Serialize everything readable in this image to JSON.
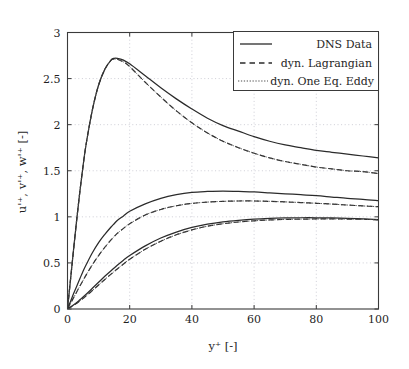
{
  "chart_data": {
    "type": "line",
    "title": "",
    "xlabel": "y⁺ [-]",
    "ylabel": "u'⁺, v'⁺, w'⁺ [-]",
    "xlim": [
      0,
      100
    ],
    "ylim": [
      0,
      3
    ],
    "xticks": [
      0,
      20,
      40,
      60,
      80,
      100
    ],
    "xtick_labels": [
      "0",
      "20",
      "40",
      "60",
      "80",
      "100"
    ],
    "yticks": [
      0,
      0.5,
      1,
      1.5,
      2,
      2.5,
      3
    ],
    "ytick_labels": [
      "0",
      "0.5",
      "1",
      "1.5",
      "2",
      "2.5",
      "3"
    ],
    "grid": true,
    "legend_position": "upper right",
    "legend_entries": [
      "DNS Data",
      "dyn. Lagrangian",
      "dyn. One Eq. Eddy"
    ],
    "x": [
      0,
      1,
      2,
      3,
      4,
      5,
      6,
      8,
      10,
      12,
      14,
      15,
      16,
      18,
      20,
      25,
      30,
      35,
      40,
      45,
      50,
      55,
      60,
      65,
      70,
      75,
      80,
      85,
      90,
      95,
      100
    ],
    "series": [
      {
        "name": "DNS Data u'⁺",
        "style": "solid",
        "color": "#2b2b2b",
        "values": [
          0,
          0.33,
          0.66,
          0.98,
          1.28,
          1.55,
          1.79,
          2.16,
          2.43,
          2.6,
          2.7,
          2.72,
          2.72,
          2.7,
          2.66,
          2.53,
          2.4,
          2.28,
          2.17,
          2.07,
          1.99,
          1.93,
          1.87,
          1.82,
          1.78,
          1.75,
          1.72,
          1.7,
          1.68,
          1.66,
          1.64
        ]
      },
      {
        "name": "dyn. Lagrangian u'⁺",
        "style": "dashed",
        "color": "#2b2b2b",
        "values": [
          0,
          0.33,
          0.66,
          0.98,
          1.28,
          1.55,
          1.79,
          2.16,
          2.43,
          2.6,
          2.7,
          2.71,
          2.71,
          2.68,
          2.63,
          2.46,
          2.3,
          2.15,
          2.02,
          1.91,
          1.82,
          1.75,
          1.69,
          1.64,
          1.6,
          1.57,
          1.54,
          1.52,
          1.5,
          1.49,
          1.47
        ]
      },
      {
        "name": "dyn. One Eq. Eddy u'⁺",
        "style": "dotted",
        "color": "#4d4d4d",
        "values": [
          0,
          0.33,
          0.66,
          0.98,
          1.28,
          1.55,
          1.79,
          2.16,
          2.43,
          2.6,
          2.7,
          2.71,
          2.71,
          2.68,
          2.63,
          2.46,
          2.3,
          2.15,
          2.02,
          1.91,
          1.82,
          1.75,
          1.69,
          1.64,
          1.6,
          1.57,
          1.54,
          1.52,
          1.5,
          1.49,
          1.47
        ]
      },
      {
        "name": "DNS Data w'⁺",
        "style": "solid",
        "color": "#2b2b2b",
        "values": [
          0,
          0.085,
          0.17,
          0.25,
          0.33,
          0.41,
          0.48,
          0.61,
          0.72,
          0.81,
          0.89,
          0.925,
          0.96,
          1.01,
          1.06,
          1.14,
          1.2,
          1.24,
          1.265,
          1.275,
          1.28,
          1.275,
          1.27,
          1.26,
          1.25,
          1.24,
          1.23,
          1.215,
          1.2,
          1.19,
          1.175
        ]
      },
      {
        "name": "dyn. Lagrangian w'⁺",
        "style": "dashed",
        "color": "#2b2b2b",
        "values": [
          0,
          0.062,
          0.125,
          0.188,
          0.25,
          0.31,
          0.37,
          0.48,
          0.58,
          0.67,
          0.75,
          0.785,
          0.82,
          0.875,
          0.925,
          1.02,
          1.08,
          1.12,
          1.145,
          1.16,
          1.168,
          1.172,
          1.172,
          1.168,
          1.162,
          1.155,
          1.147,
          1.138,
          1.128,
          1.118,
          1.11
        ]
      },
      {
        "name": "dyn. One Eq. Eddy w'⁺",
        "style": "dotted",
        "color": "#4d4d4d",
        "values": [
          0,
          0.062,
          0.125,
          0.188,
          0.25,
          0.31,
          0.37,
          0.48,
          0.58,
          0.67,
          0.75,
          0.785,
          0.82,
          0.875,
          0.925,
          1.02,
          1.08,
          1.12,
          1.145,
          1.16,
          1.168,
          1.172,
          1.172,
          1.168,
          1.162,
          1.155,
          1.147,
          1.138,
          1.128,
          1.118,
          1.11
        ]
      },
      {
        "name": "DNS Data v'⁺",
        "style": "solid",
        "color": "#2b2b2b",
        "values": [
          0,
          0.022,
          0.045,
          0.07,
          0.1,
          0.13,
          0.16,
          0.225,
          0.29,
          0.355,
          0.415,
          0.445,
          0.475,
          0.53,
          0.58,
          0.685,
          0.77,
          0.835,
          0.885,
          0.92,
          0.945,
          0.962,
          0.975,
          0.983,
          0.988,
          0.99,
          0.99,
          0.988,
          0.984,
          0.978,
          0.97
        ]
      },
      {
        "name": "dyn. Lagrangian v'⁺",
        "style": "dashed",
        "color": "#2b2b2b",
        "values": [
          0,
          0.02,
          0.04,
          0.062,
          0.088,
          0.115,
          0.142,
          0.2,
          0.26,
          0.32,
          0.378,
          0.406,
          0.434,
          0.488,
          0.54,
          0.648,
          0.735,
          0.805,
          0.858,
          0.898,
          0.925,
          0.944,
          0.957,
          0.966,
          0.972,
          0.975,
          0.977,
          0.977,
          0.976,
          0.973,
          0.968
        ]
      },
      {
        "name": "dyn. One Eq. Eddy v'⁺",
        "style": "dotted",
        "color": "#4d4d4d",
        "values": [
          0,
          0.02,
          0.04,
          0.062,
          0.088,
          0.115,
          0.142,
          0.2,
          0.26,
          0.32,
          0.378,
          0.406,
          0.434,
          0.488,
          0.54,
          0.648,
          0.735,
          0.805,
          0.858,
          0.898,
          0.925,
          0.944,
          0.957,
          0.966,
          0.972,
          0.975,
          0.977,
          0.977,
          0.976,
          0.973,
          0.968
        ]
      }
    ]
  },
  "colors": {
    "frame": "#3a3a3a",
    "grid": "#b9b9c4",
    "dns": "#2b2b2b",
    "lagrangian": "#2b2b2b",
    "oneeq": "#4d4d4d",
    "background": "#ffffff"
  }
}
